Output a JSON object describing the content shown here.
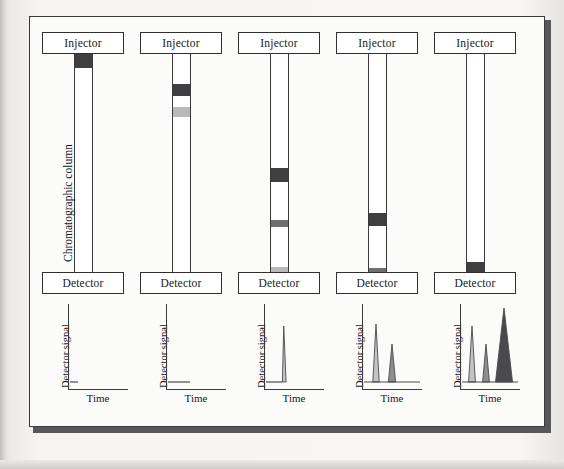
{
  "figure": {
    "column_caption": "Chromatographic column",
    "injector_label": "Injector",
    "detector_label": "Detector",
    "detector_signal_label": "Detector signal",
    "time_label": "Time"
  },
  "colors": {
    "band_dark": "#3f3f42",
    "band_medium": "#6f6f72",
    "band_light": "#b9b9bc",
    "outline": "#3a3a3c",
    "paper": "#fbfbfa",
    "frame_shadow": "#57565a",
    "peak_light": "#c3c3c6",
    "peak_medium": "#8e8e91",
    "peak_dark": "#4a4a4d",
    "peak_outline": "#4b4b4e"
  },
  "panels": [
    {
      "id": "panel-1",
      "stage": "injection",
      "bands": [
        {
          "name": "mixed-plug",
          "top_pct": 0,
          "height_pct": 6.4,
          "shade": "band_dark"
        }
      ],
      "chromatogram": {
        "type": "line",
        "title": "",
        "xlabel": "Time",
        "ylabel": "Detector signal",
        "xlim": [
          0,
          60
        ],
        "ylim": [
          0,
          86
        ],
        "baseline_y": 78,
        "baseline_x": [
          2,
          10
        ],
        "peaks": []
      }
    },
    {
      "id": "panel-2",
      "stage": "early-separation",
      "bands": [
        {
          "name": "band-a-dark",
          "top_pct": 13.7,
          "height_pct": 5.5,
          "shade": "band_dark"
        },
        {
          "name": "band-b-light",
          "top_pct": 24.2,
          "height_pct": 4.6,
          "shade": "band_light"
        }
      ],
      "chromatogram": {
        "type": "line",
        "title": "",
        "xlabel": "Time",
        "ylabel": "Detector signal",
        "xlim": [
          0,
          60
        ],
        "ylim": [
          0,
          86
        ],
        "baseline_y": 78,
        "baseline_x": [
          2,
          24
        ],
        "peaks": []
      }
    },
    {
      "id": "panel-3",
      "stage": "mid-separation",
      "bands": [
        {
          "name": "band-a-dark",
          "top_pct": 52.0,
          "height_pct": 6.4,
          "shade": "band_dark"
        },
        {
          "name": "band-b-medium",
          "top_pct": 76.0,
          "height_pct": 3.2,
          "shade": "band_medium"
        },
        {
          "name": "band-c-light-eluting",
          "top_pct": 97.3,
          "height_pct": 2.7,
          "shade": "band_light"
        }
      ],
      "chromatogram": {
        "type": "line",
        "title": "",
        "xlabel": "Time",
        "ylabel": "Detector signal",
        "xlim": [
          0,
          60
        ],
        "ylim": [
          0,
          86
        ],
        "baseline_y": 78,
        "baseline_x": [
          2,
          18
        ],
        "peaks": [
          {
            "name": "peak-1",
            "center": 20,
            "height": 56,
            "half_width": 1.6,
            "fill": "peak_light",
            "skewed": true
          }
        ]
      }
    },
    {
      "id": "panel-4",
      "stage": "late-separation",
      "bands": [
        {
          "name": "band-a-dark",
          "top_pct": 72.6,
          "height_pct": 6.0,
          "shade": "band_dark"
        },
        {
          "name": "band-b-medium-eluting",
          "top_pct": 97.7,
          "height_pct": 2.3,
          "shade": "band_medium"
        }
      ],
      "chromatogram": {
        "type": "line",
        "title": "",
        "xlabel": "Time",
        "ylabel": "Detector signal",
        "xlim": [
          0,
          60
        ],
        "ylim": [
          0,
          86
        ],
        "baseline_y": 78,
        "baseline_x": [
          2,
          58
        ],
        "peaks": [
          {
            "name": "peak-1",
            "center": 14,
            "height": 58,
            "half_width": 3.2,
            "fill": "peak_light",
            "skewed": false
          },
          {
            "name": "peak-2",
            "center": 30,
            "height": 38,
            "half_width": 3.6,
            "fill": "peak_medium",
            "skewed": false
          }
        ]
      }
    },
    {
      "id": "panel-5",
      "stage": "complete-elution",
      "bands": [
        {
          "name": "band-a-dark-eluting",
          "top_pct": 95.0,
          "height_pct": 5.0,
          "shade": "band_dark"
        }
      ],
      "chromatogram": {
        "type": "line",
        "title": "",
        "xlabel": "Time",
        "ylabel": "Detector signal",
        "xlim": [
          0,
          60
        ],
        "ylim": [
          0,
          86
        ],
        "baseline_y": 78,
        "baseline_x": [
          2,
          58
        ],
        "peaks": [
          {
            "name": "peak-1",
            "center": 12,
            "height": 56,
            "half_width": 3.4,
            "fill": "peak_light",
            "skewed": false
          },
          {
            "name": "peak-2",
            "center": 26,
            "height": 38,
            "half_width": 3.4,
            "fill": "peak_medium",
            "skewed": false
          },
          {
            "name": "peak-3",
            "center": 44,
            "height": 74,
            "half_width": 8.5,
            "fill": "peak_dark",
            "skewed": false
          }
        ]
      }
    }
  ],
  "chart_data": {
    "type": "line",
    "xlabel": "Time",
    "ylabel": "Detector signal",
    "xlim": [
      0,
      60
    ],
    "ylim": [
      0,
      86
    ],
    "grid": false,
    "legend": "none",
    "series": [
      {
        "name": "Stage 1 — injection (no elution)",
        "peaks": [],
        "baseline_length": 8
      },
      {
        "name": "Stage 2 — bands migrating (no elution)",
        "peaks": [],
        "baseline_length": 22
      },
      {
        "name": "Stage 3 — first band eluting",
        "peaks": [
          {
            "time": 20,
            "height": 56,
            "width": 3.2,
            "shade": "light"
          }
        ]
      },
      {
        "name": "Stage 4 — two bands eluted",
        "peaks": [
          {
            "time": 14,
            "height": 58,
            "width": 6.4,
            "shade": "light"
          },
          {
            "time": 30,
            "height": 38,
            "width": 7.2,
            "shade": "medium"
          }
        ]
      },
      {
        "name": "Stage 5 — three bands eluted",
        "peaks": [
          {
            "time": 12,
            "height": 56,
            "width": 6.8,
            "shade": "light"
          },
          {
            "time": 26,
            "height": 38,
            "width": 6.8,
            "shade": "medium"
          },
          {
            "time": 44,
            "height": 74,
            "width": 17,
            "shade": "dark"
          }
        ]
      }
    ]
  }
}
